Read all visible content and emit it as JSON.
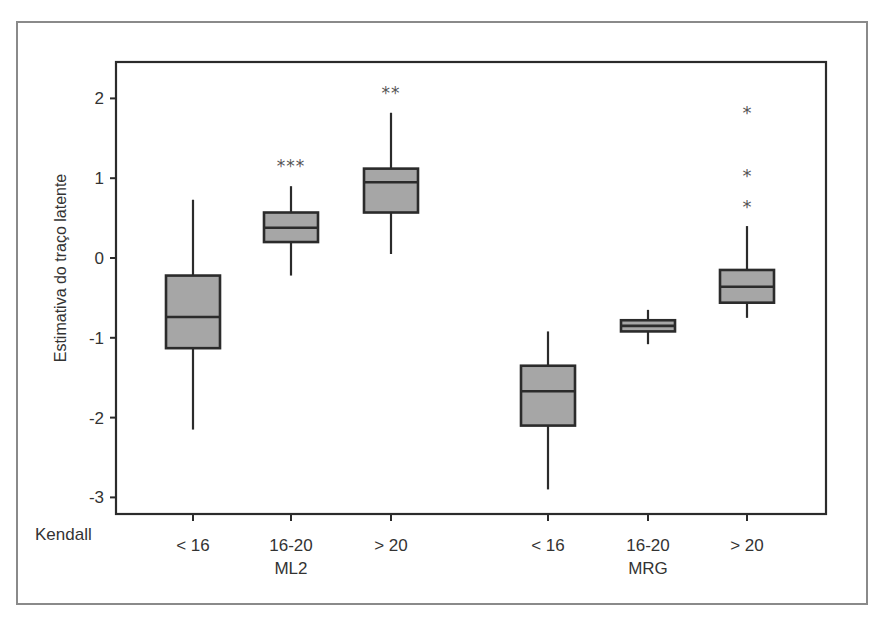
{
  "chart_data": {
    "type": "boxplot",
    "title": "",
    "ylabel": "Estimativa do traço latente",
    "xlabel": "",
    "x_row_label": "Kendall",
    "ylim": [
      -3.2,
      2.45
    ],
    "yticks": [
      2,
      1,
      0,
      -1,
      -2,
      -3
    ],
    "ytick_labels": [
      "2",
      "1",
      "0",
      "-1",
      "-2",
      "-3"
    ],
    "grid": false,
    "legend": null,
    "groups": [
      {
        "name": "ML2",
        "categories": [
          {
            "label": "< 16",
            "min": -2.15,
            "q1": -1.13,
            "median": -0.74,
            "q3": -0.22,
            "max": 0.73,
            "outliers": [],
            "annotation": ""
          },
          {
            "label": "16-20",
            "min": -0.22,
            "q1": 0.2,
            "median": 0.38,
            "q3": 0.57,
            "max": 0.9,
            "outliers": [],
            "annotation": "***"
          },
          {
            "label": "> 20",
            "min": 0.05,
            "q1": 0.57,
            "median": 0.95,
            "q3": 1.12,
            "max": 1.82,
            "outliers": [],
            "annotation": "**"
          }
        ]
      },
      {
        "name": "MRG",
        "categories": [
          {
            "label": "< 16",
            "min": -2.9,
            "q1": -2.1,
            "median": -1.67,
            "q3": -1.35,
            "max": -0.92,
            "outliers": [],
            "annotation": ""
          },
          {
            "label": "16-20",
            "min": -1.08,
            "q1": -0.92,
            "median": -0.85,
            "q3": -0.78,
            "max": -0.65,
            "outliers": [],
            "annotation": ""
          },
          {
            "label": "> 20",
            "min": -0.75,
            "q1": -0.56,
            "median": -0.36,
            "q3": -0.15,
            "max": 0.4,
            "outliers": [
              1.85,
              1.07,
              0.68
            ],
            "annotation": ""
          }
        ]
      }
    ],
    "colors": {
      "box_fill": "#a6a6a6",
      "box_stroke": "#2b2b2b",
      "axis": "#2b2b2b",
      "frame": "#8a8a8a",
      "marker": "#555555"
    }
  }
}
